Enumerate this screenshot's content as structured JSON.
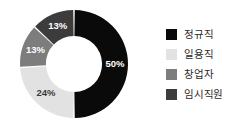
{
  "chart_data": {
    "type": "pie",
    "variant": "donut",
    "title": "",
    "subtitle": "",
    "xlabel": "",
    "ylabel": "",
    "grid": false,
    "background_color": "#ffffff",
    "start_angle_deg": 0,
    "direction": "clockwise",
    "inner_radius_ratio": 0.52,
    "categories": [
      "정규직",
      "일용직",
      "창업자",
      "임시직원"
    ],
    "values": [
      50,
      24,
      13,
      13
    ],
    "value_labels": [
      "50%",
      "24%",
      "13%",
      "13%"
    ],
    "colors": [
      "#0a0a0a",
      "#e2e2e2",
      "#7d7d7d",
      "#3c3c3c"
    ],
    "label_text_colors": [
      "#ffffff",
      "#3a3a3a",
      "#ffffff",
      "#ffffff"
    ],
    "legend": {
      "position": "right",
      "entries": [
        {
          "label": "정규직",
          "color": "#0a0a0a",
          "value_label": "50%"
        },
        {
          "label": "일용직",
          "color": "#e2e2e2",
          "value_label": "24%"
        },
        {
          "label": "창업자",
          "color": "#7d7d7d",
          "value_label": "13%"
        },
        {
          "label": "임시직원",
          "color": "#3c3c3c",
          "value_label": "13%"
        }
      ]
    }
  }
}
